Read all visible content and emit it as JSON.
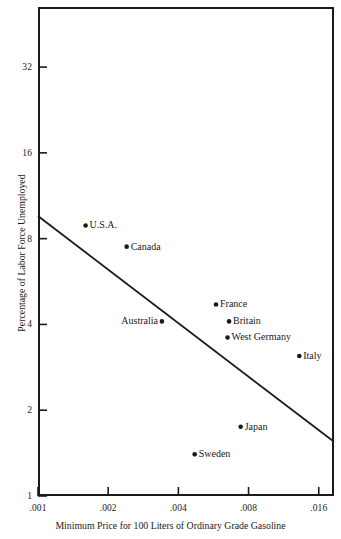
{
  "chart_data": {
    "type": "scatter",
    "title": "",
    "subtitle": "",
    "xlabel": "Minimum Price for 100 Liters of Ordinary Grade Gasoline",
    "ylabel": "Percentage of Labor Force Unemployed",
    "xscale": "log",
    "yscale": "log",
    "xlim": [
      0.001,
      0.0186
    ],
    "ylim": [
      1,
      52
    ],
    "xticks": [
      0.001,
      0.002,
      0.004,
      0.008,
      0.016
    ],
    "xtick_labels": [
      ".001",
      ".002",
      ".004",
      ".008",
      ".016"
    ],
    "yticks": [
      1,
      2,
      4,
      8,
      16,
      32
    ],
    "ytick_labels": [
      "1",
      "2",
      "4",
      "8",
      "16",
      "32"
    ],
    "grid": false,
    "legend": "none",
    "points": [
      {
        "name": "U.S.A.",
        "x": 0.0016,
        "y": 8.9,
        "label_side": "right"
      },
      {
        "name": "Canada",
        "x": 0.0024,
        "y": 7.5,
        "label_side": "right"
      },
      {
        "name": "Australia",
        "x": 0.0034,
        "y": 4.1,
        "label_side": "left"
      },
      {
        "name": "France",
        "x": 0.0058,
        "y": 4.7,
        "label_side": "right"
      },
      {
        "name": "Britain",
        "x": 0.0066,
        "y": 4.1,
        "label_side": "right"
      },
      {
        "name": "West Germany",
        "x": 0.0065,
        "y": 3.6,
        "label_side": "right"
      },
      {
        "name": "Italy",
        "x": 0.0132,
        "y": 3.1,
        "label_side": "right"
      },
      {
        "name": "Japan",
        "x": 0.0074,
        "y": 1.75,
        "label_side": "right"
      },
      {
        "name": "Sweden",
        "x": 0.0047,
        "y": 1.4,
        "label_side": "right"
      }
    ],
    "trend_line": {
      "type": "linear-fit-on-log-log",
      "start": {
        "x": 0.001,
        "y": 9.6
      },
      "end": {
        "x": 0.0186,
        "y": 1.55
      }
    },
    "colors": {
      "axis": "#1a1a1a",
      "marker": "#1a1a1a",
      "trend_line": "#1a1a1a",
      "background": "#ffffff"
    }
  }
}
